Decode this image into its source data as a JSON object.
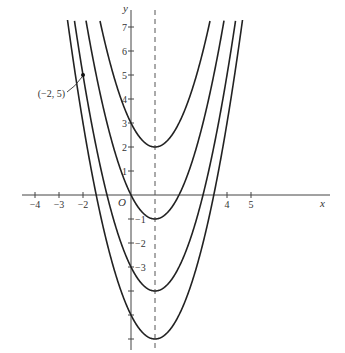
{
  "chart_data": {
    "type": "line",
    "title": "",
    "xlabel": "x",
    "ylabel": "y",
    "origin_label": "O",
    "xlim": [
      -4.5,
      8.2
    ],
    "ylim": [
      -6.5,
      8
    ],
    "x_ticks": [
      -4,
      -3,
      -2,
      4,
      5
    ],
    "x_tick_labels": [
      "−4",
      "−3",
      "−2",
      "4",
      "5"
    ],
    "y_ticks": [
      7,
      6,
      5,
      4,
      3,
      2,
      1,
      -1,
      -2,
      -3
    ],
    "y_tick_labels": [
      "7",
      "6",
      "5",
      "4",
      "3",
      "2",
      "1",
      "−1",
      "−2",
      "−3"
    ],
    "y_ticks_unlabeled": [
      -4,
      -5,
      -6
    ],
    "axis_of_symmetry": {
      "x": 1,
      "style": "dashed"
    },
    "series": [
      {
        "name": "y = (x−1)² + 2",
        "a": 1,
        "h": 1,
        "k": 2,
        "vertex": [
          1,
          2
        ],
        "y_intercept": 3
      },
      {
        "name": "y = (x−1)² − 1",
        "a": 1,
        "h": 1,
        "k": -1,
        "vertex": [
          1,
          -1
        ],
        "y_intercept": 0
      },
      {
        "name": "y = (x−1)² − 4",
        "a": 1,
        "h": 1,
        "k": -4,
        "vertex": [
          1,
          -4
        ],
        "y_intercept": -3
      },
      {
        "name": "y = (x−1)² − 6",
        "a": 1,
        "h": 1,
        "k": -6,
        "vertex": [
          1,
          -6
        ],
        "y_intercept": -5
      }
    ],
    "annotations": [
      {
        "text": "(−2, 5)",
        "point": [
          -2,
          5
        ],
        "on_series": "y = (x−1)² − 4"
      }
    ],
    "grid": false,
    "legend": "none"
  }
}
